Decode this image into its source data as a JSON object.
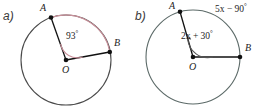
{
  "figure": {
    "background_color": "#ffffff",
    "stroke_color": "#4a4a4a",
    "chord_color": "#111111",
    "arc_highlight_color": "#c9909a",
    "point_color": "#111111"
  },
  "panels": [
    {
      "tag": "a)",
      "center_label": "O",
      "point_a_label": "A",
      "point_b_label": "B",
      "angle_label": "93",
      "degree_symbol": "°",
      "angle_full": "93°",
      "arc_highlighted": true,
      "arc_color": "#c9909a"
    },
    {
      "tag": "b)",
      "center_label": "O",
      "point_a_label": "A",
      "point_b_label": "B",
      "angle_expression": "2x + 30",
      "angle_expression_var": "x",
      "degree_symbol": "°",
      "angle_full": "2x + 30°",
      "arc_label_expression": "5x − 90",
      "arc_label_full": "5x − 90°",
      "arc_highlighted": false,
      "arc_color": "#4a4a4a"
    }
  ]
}
